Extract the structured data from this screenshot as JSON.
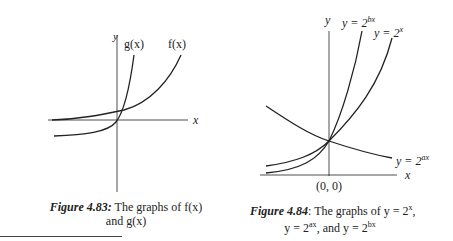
{
  "figure_left": {
    "axis_x_label": "x",
    "axis_y_label": "y",
    "curve_labels": {
      "g": "g(x)",
      "f": "f(x)"
    },
    "caption": {
      "number": "Figure 4.83:",
      "line1": " The graphs of f(x)",
      "line2": "and g(x)"
    }
  },
  "figure_right": {
    "axis_x_label": "x",
    "axis_y_label": "y",
    "origin_label": "(0, 0)",
    "curve_labels": {
      "bx": "y = 2",
      "bx_exp": "bx",
      "x": "y = 2",
      "x_exp": "x",
      "ax": "y = 2",
      "ax_exp": "ax"
    },
    "caption": {
      "number": "Figure 4.84",
      "line1": ": The graphs of y = 2",
      "line1_exp": "x",
      "line1_end": ",",
      "line2": "y = 2",
      "line2_exp": "ax",
      "line2_mid": ", and y = 2",
      "line2_exp2": "bx"
    }
  }
}
